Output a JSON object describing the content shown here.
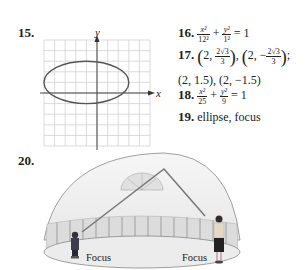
{
  "problems": {
    "p15": {
      "label": "15.",
      "graph": {
        "x_axis_label": "x",
        "y_axis_label": "y",
        "grid_cells": 10,
        "ellipse": {
          "cx_units": -1,
          "cy_units": 1,
          "rx_units": 4,
          "ry_units": 2
        }
      }
    },
    "p16": {
      "label": "16.",
      "num1": "x²",
      "den1": "12²",
      "plus": "+",
      "num2": "y²",
      "den2": "1²",
      "rhs": "= 1"
    },
    "p17": {
      "label": "17.",
      "pt1_x": "2,",
      "pt1_num": "2√3",
      "pt1_den": "3",
      "pt2_x": "2, −",
      "pt2_num": "2√3",
      "pt2_den": "3",
      "line2": "(2, 1.5), (2, −1.5)"
    },
    "p18": {
      "label": "18.",
      "num1": "x²",
      "den1": "25",
      "plus": "+",
      "num2": "y²",
      "den2": "9",
      "rhs": "= 1"
    },
    "p19": {
      "label": "19.",
      "text": "ellipse, focus"
    },
    "p20": {
      "label": "20.",
      "focus_left": "Focus",
      "focus_right": "Focus"
    }
  }
}
